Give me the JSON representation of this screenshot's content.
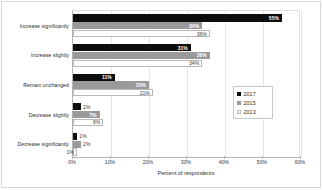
{
  "chart_data": {
    "type": "bar",
    "orientation": "horizontal",
    "title": "",
    "xlabel": "Percent of respondents",
    "ylabel": "",
    "xlim": [
      0,
      60
    ],
    "xticks": [
      "0%",
      "10%",
      "20%",
      "30%",
      "40%",
      "50%",
      "60%"
    ],
    "xtick_values": [
      0,
      10,
      20,
      30,
      40,
      50,
      60
    ],
    "grid": true,
    "legend_position": "right",
    "categories": [
      "Increase significantly",
      "Increase slightly",
      "Remain unchanged",
      "Decrease slightly",
      "Decrease significantly"
    ],
    "series": [
      {
        "name": "2017",
        "color": "#0d0d0d",
        "values": [
          55,
          31,
          11,
          2,
          1
        ],
        "labels": [
          "55%",
          "31%",
          "11%",
          "2%",
          "1%"
        ]
      },
      {
        "name": "2015",
        "color": "#9a9a9a",
        "values": [
          34,
          36,
          20,
          7,
          2
        ],
        "labels": [
          "34%",
          "36%",
          "20%",
          "7%",
          "2%"
        ]
      },
      {
        "name": "2013",
        "color": "#ffffff",
        "values": [
          36,
          34,
          21,
          8,
          1
        ],
        "labels": [
          "36%",
          "34%",
          "21%",
          "8%",
          "1%"
        ]
      }
    ]
  },
  "legend": {
    "items": [
      {
        "label": "2017"
      },
      {
        "label": "2015"
      },
      {
        "label": "2013"
      }
    ]
  }
}
